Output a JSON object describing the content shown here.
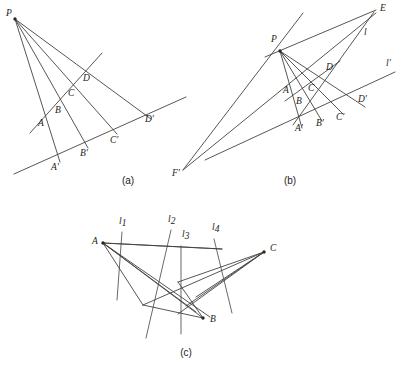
{
  "figure": {
    "background_color": "#ffffff",
    "ink_color": "#45433f",
    "label_color": "#1d1b19",
    "width": 412,
    "height": 367
  },
  "panels": [
    {
      "id": "panel-a",
      "caption": "(a)",
      "caption_pos": {
        "x": 128,
        "y": 184
      },
      "points": [
        {
          "name": "P",
          "x": 15,
          "y": 19,
          "label": "P",
          "label_x": 6,
          "label_y": 16,
          "dot": true
        },
        {
          "name": "A",
          "x": 44,
          "y": 111,
          "label": "A",
          "label_x": 38,
          "label_y": 126,
          "dot": false
        },
        {
          "name": "B",
          "x": 61,
          "y": 98,
          "label": "B",
          "label_x": 55,
          "label_y": 113,
          "dot": false
        },
        {
          "name": "C",
          "x": 73,
          "y": 84,
          "label": "C",
          "label_x": 68,
          "label_y": 96,
          "dot": false
        },
        {
          "name": "D",
          "x": 86,
          "y": 70,
          "label": "D",
          "label_x": 83,
          "label_y": 81,
          "dot": false
        },
        {
          "name": "A'",
          "x": 57,
          "y": 156,
          "label": "A'",
          "label_x": 51,
          "label_y": 170,
          "dot": false
        },
        {
          "name": "B'",
          "x": 85,
          "y": 142,
          "label": "B'",
          "label_x": 80,
          "label_y": 156,
          "dot": false
        },
        {
          "name": "C'",
          "x": 114,
          "y": 129,
          "label": "C'",
          "label_x": 110,
          "label_y": 143,
          "dot": false
        },
        {
          "name": "D'",
          "x": 148,
          "y": 114,
          "label": "D'",
          "label_x": 145,
          "label_y": 122,
          "dot": false
        }
      ],
      "lines": [
        {
          "name": "ray-P-A-A'",
          "x1": 15,
          "y1": 19,
          "x2": 60,
          "y2": 162
        },
        {
          "name": "ray-P-B-B'",
          "x1": 15,
          "y1": 19,
          "x2": 88,
          "y2": 148
        },
        {
          "name": "ray-P-C-C'",
          "x1": 15,
          "y1": 19,
          "x2": 117,
          "y2": 134
        },
        {
          "name": "ray-P-D-D'",
          "x1": 15,
          "y1": 19,
          "x2": 151,
          "y2": 119
        },
        {
          "name": "line-ABCD",
          "x1": 30,
          "y1": 133,
          "x2": 102,
          "y2": 53
        },
        {
          "name": "line-A'B'C'D'",
          "x1": 14,
          "y1": 174,
          "x2": 186,
          "y2": 97
        }
      ]
    },
    {
      "id": "panel-b",
      "caption": "(b)",
      "caption_pos": {
        "x": 290,
        "y": 184
      },
      "points": [
        {
          "name": "P",
          "x": 280,
          "y": 51,
          "label": "P",
          "label_x": 271,
          "label_y": 42,
          "dot": true
        },
        {
          "name": "E",
          "x": 374,
          "y": 11,
          "label": "E",
          "label_x": 380,
          "label_y": 11,
          "dot": false
        },
        {
          "name": "F'",
          "x": 183,
          "y": 170,
          "label": "F'",
          "label_x": 172,
          "label_y": 176,
          "dot": false
        },
        {
          "name": "A",
          "x": 291,
          "y": 93,
          "label": "A",
          "label_x": 283,
          "label_y": 93,
          "dot": false
        },
        {
          "name": "B",
          "x": 301,
          "y": 100,
          "label": "B",
          "label_x": 296,
          "label_y": 104,
          "dot": false
        },
        {
          "name": "C",
          "x": 311,
          "y": 89,
          "label": "C",
          "label_x": 308,
          "label_y": 91,
          "dot": false
        },
        {
          "name": "D",
          "x": 327,
          "y": 73,
          "label": "D",
          "label_x": 326,
          "label_y": 70,
          "dot": false
        },
        {
          "name": "A'",
          "x": 300,
          "y": 122,
          "label": "A'",
          "label_x": 295,
          "label_y": 131,
          "dot": false
        },
        {
          "name": "B'",
          "x": 320,
          "y": 116,
          "label": "B'",
          "label_x": 316,
          "label_y": 126,
          "dot": false
        },
        {
          "name": "C'",
          "x": 340,
          "y": 110,
          "label": "C'",
          "label_x": 336,
          "label_y": 120,
          "dot": false
        },
        {
          "name": "D'",
          "x": 362,
          "y": 103,
          "label": "D'",
          "label_x": 358,
          "label_y": 102,
          "dot": false
        }
      ],
      "line_labels": [
        {
          "name": "l",
          "text": "l",
          "x": 364,
          "y": 35
        },
        {
          "name": "l'",
          "text": "l'",
          "x": 386,
          "y": 66
        }
      ],
      "lines": [
        {
          "name": "ray-P-A-A'",
          "x1": 280,
          "y1": 51,
          "x2": 302,
          "y2": 128
        },
        {
          "name": "ray-P-B-B'",
          "x1": 280,
          "y1": 51,
          "x2": 322,
          "y2": 121
        },
        {
          "name": "ray-P-C-C'",
          "x1": 280,
          "y1": 51,
          "x2": 343,
          "y2": 114
        },
        {
          "name": "ray-P-D-D'",
          "x1": 280,
          "y1": 51,
          "x2": 365,
          "y2": 107
        },
        {
          "name": "line-P-E",
          "x1": 265,
          "y1": 57,
          "x2": 376,
          "y2": 10
        },
        {
          "name": "line-E-D-A'",
          "x1": 374,
          "y1": 12,
          "x2": 293,
          "y2": 125
        },
        {
          "name": "line-E-F'",
          "x1": 376,
          "y1": 13,
          "x2": 183,
          "y2": 170
        },
        {
          "name": "line-F'-P-up",
          "x1": 183,
          "y1": 170,
          "x2": 303,
          "y2": 13
        },
        {
          "name": "line-l-prime",
          "x1": 205,
          "y1": 160,
          "x2": 395,
          "y2": 72
        },
        {
          "name": "line-A-D-seg",
          "x1": 285,
          "y1": 101,
          "x2": 340,
          "y2": 61
        }
      ]
    },
    {
      "id": "panel-c",
      "caption": "(c)",
      "caption_pos": {
        "x": 186,
        "y": 356
      },
      "points": [
        {
          "name": "A",
          "x": 103,
          "y": 243,
          "label": "A",
          "label_x": 92,
          "label_y": 244,
          "dot": true
        },
        {
          "name": "B",
          "x": 203,
          "y": 318,
          "label": "B",
          "label_x": 210,
          "label_y": 322,
          "dot": true
        },
        {
          "name": "C",
          "x": 264,
          "y": 252,
          "label": "C",
          "label_x": 270,
          "label_y": 251,
          "dot": true
        }
      ],
      "line_labels": [
        {
          "name": "l1",
          "base": "l",
          "sub": "1",
          "x": 119,
          "y": 224
        },
        {
          "name": "l2",
          "base": "l",
          "sub": "2",
          "x": 168,
          "y": 222
        },
        {
          "name": "l3",
          "base": "l",
          "sub": "3",
          "x": 182,
          "y": 237
        },
        {
          "name": "l4",
          "base": "l",
          "sub": "4",
          "x": 212,
          "y": 230
        }
      ],
      "fan_from_A": [
        {
          "name": "A-to-p1",
          "x2": 222,
          "y2": 249
        },
        {
          "name": "A-to-p2",
          "x2": 196,
          "y2": 312
        },
        {
          "name": "A-to-p3",
          "x2": 203,
          "y2": 318
        },
        {
          "name": "A-to-p4",
          "x2": 210,
          "y2": 317
        }
      ],
      "fan_from_C": [
        {
          "name": "C-to-q1",
          "x2": 143,
          "y2": 305
        },
        {
          "name": "C-to-q2",
          "x2": 178,
          "y2": 314
        },
        {
          "name": "C-to-q3",
          "x2": 186,
          "y2": 306
        },
        {
          "name": "C-to-q4",
          "x2": 196,
          "y2": 297
        }
      ],
      "extra_segments": [
        {
          "name": "seg-A-top-right",
          "x1": 103,
          "y1": 243,
          "x2": 222,
          "y2": 249
        },
        {
          "name": "seg-bottom-left",
          "x1": 103,
          "y1": 243,
          "x2": 143,
          "y2": 305
        },
        {
          "name": "seg-base-B",
          "x1": 143,
          "y1": 305,
          "x2": 203,
          "y2": 318
        },
        {
          "name": "seg-C-left",
          "x1": 264,
          "y1": 252,
          "x2": 178,
          "y2": 282
        },
        {
          "name": "seg-cross-1",
          "x1": 178,
          "y1": 282,
          "x2": 203,
          "y2": 318
        }
      ],
      "transversals": [
        {
          "name": "l1-line",
          "x1": 122,
          "y1": 232,
          "x2": 117,
          "y2": 300
        },
        {
          "name": "l2-line",
          "x1": 171,
          "y1": 230,
          "x2": 146,
          "y2": 338
        },
        {
          "name": "l3-line",
          "x1": 181,
          "y1": 246,
          "x2": 181,
          "y2": 334
        },
        {
          "name": "l4-line",
          "x1": 214,
          "y1": 239,
          "x2": 232,
          "y2": 313
        }
      ]
    }
  ]
}
